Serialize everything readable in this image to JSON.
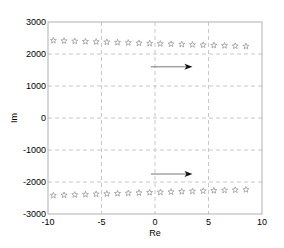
{
  "chart_data": {
    "type": "scatter",
    "title": "",
    "xlabel": "Re",
    "ylabel": "Im",
    "xlim": [
      -10,
      10
    ],
    "ylim": [
      -3000,
      3000
    ],
    "xticks": [
      -10,
      -5,
      0,
      5,
      10
    ],
    "yticks": [
      3000,
      2000,
      1000,
      0,
      -1000,
      -2000,
      -3000
    ],
    "xtick_labels": [
      "-10",
      "-5",
      "0",
      "5",
      "10"
    ],
    "ytick_labels": [
      "3000",
      "2000",
      "1000",
      "0",
      "-1000",
      "-2000",
      "-3000"
    ],
    "grid": true,
    "grid_style": "dashed",
    "marker": "pentagram",
    "marker_color": "#9a9a9a",
    "series": [
      {
        "name": "upper poles",
        "x": [
          -9.5,
          -8.5,
          -7.5,
          -6.5,
          -5.5,
          -4.5,
          -3.5,
          -2.5,
          -1.5,
          -0.5,
          0.5,
          1.5,
          2.5,
          3.5,
          4.5,
          5.5,
          6.5,
          7.5,
          8.5
        ],
        "y": [
          2420,
          2410,
          2400,
          2390,
          2380,
          2370,
          2360,
          2350,
          2340,
          2330,
          2320,
          2310,
          2300,
          2290,
          2280,
          2270,
          2260,
          2250,
          2240
        ]
      },
      {
        "name": "lower poles",
        "x": [
          -9.5,
          -8.5,
          -7.5,
          -6.5,
          -5.5,
          -4.5,
          -3.5,
          -2.5,
          -1.5,
          -0.5,
          0.5,
          1.5,
          2.5,
          3.5,
          4.5,
          5.5,
          6.5,
          7.5,
          8.5
        ],
        "y": [
          -2420,
          -2410,
          -2400,
          -2390,
          -2380,
          -2370,
          -2360,
          -2350,
          -2340,
          -2330,
          -2320,
          -2310,
          -2300,
          -2290,
          -2280,
          -2270,
          -2260,
          -2250,
          -2240
        ]
      }
    ],
    "annotations": [
      {
        "type": "arrow",
        "from": [
          1.3,
          1600
        ],
        "to": [
          3.5,
          1600
        ],
        "direction": "right"
      },
      {
        "type": "arrow",
        "from": [
          1.3,
          -1750
        ],
        "to": [
          3.5,
          -1750
        ],
        "direction": "right"
      }
    ]
  }
}
